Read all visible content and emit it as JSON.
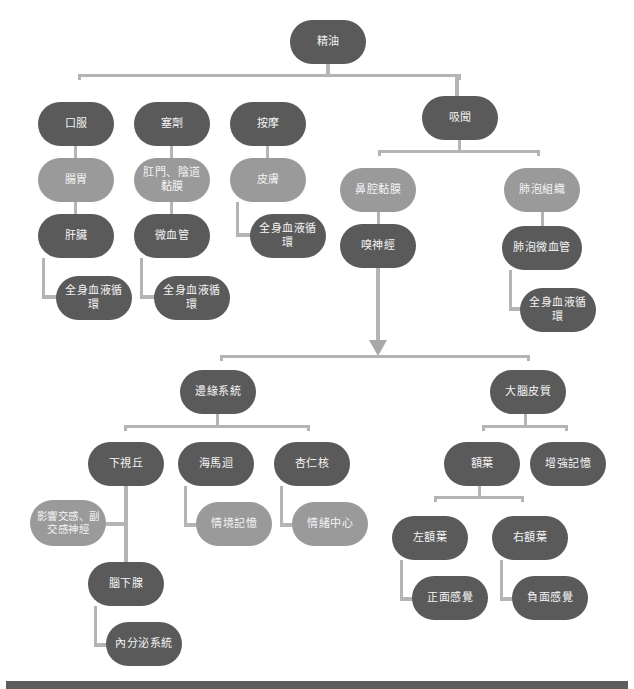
{
  "colors": {
    "dark_node": "#5a5a5a",
    "light_node": "#9a9a9a",
    "connector": "#b4b4b4",
    "footer_bar": "#5e5e5e"
  },
  "root": {
    "label": "精油"
  },
  "routes": [
    {
      "label": "口服",
      "children": [
        {
          "label": "腸胃"
        },
        {
          "label": "肝臟"
        },
        {
          "label": "全身血液循環"
        }
      ]
    },
    {
      "label": "塞劑",
      "children": [
        {
          "label": "肛門、陰道黏膜"
        },
        {
          "label": "微血管"
        },
        {
          "label": "全身血液循環"
        }
      ]
    },
    {
      "label": "按摩",
      "children": [
        {
          "label": "皮膚"
        },
        {
          "label": "全身血液循環"
        }
      ]
    },
    {
      "label": "吸聞",
      "branches": [
        {
          "label": "鼻腔黏膜",
          "children": [
            {
              "label": "嗅神經"
            }
          ]
        },
        {
          "label": "肺泡組織",
          "children": [
            {
              "label": "肺泡微血管"
            },
            {
              "label": "全身血液循環"
            }
          ]
        }
      ]
    }
  ],
  "brain": {
    "limbic": {
      "label": "邊緣系統",
      "children": [
        {
          "label": "下視丘",
          "side": "影響交感、副交感神經",
          "next": "腦下腺",
          "final": "內分泌系統"
        },
        {
          "label": "海馬迴",
          "child": "情境記憶"
        },
        {
          "label": "杏仁核",
          "child": "情緒中心"
        }
      ]
    },
    "cortex": {
      "label": "大腦皮質",
      "children": [
        {
          "label": "額葉",
          "children": [
            {
              "label": "左額葉",
              "child": "正面感覺"
            },
            {
              "label": "右額葉",
              "child": "負面感覺"
            }
          ]
        },
        {
          "label": "增強記憶"
        }
      ]
    }
  }
}
